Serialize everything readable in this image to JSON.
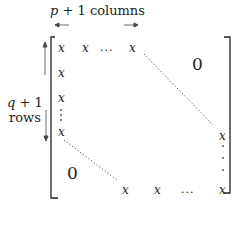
{
  "diagram": {
    "column_label": {
      "var": "p",
      "rest": " + 1 columns"
    },
    "row_label": {
      "var": "q",
      "rest": " + 1",
      "line2": "rows"
    },
    "arrows": {
      "left": "←",
      "right": "→"
    },
    "top_row": [
      "x",
      "x",
      "...",
      "x"
    ],
    "left_column": [
      "x",
      "x",
      "x"
    ],
    "bottom_row": [
      "x",
      "x",
      "...",
      "x"
    ],
    "right_column": [
      "x"
    ],
    "upper_zero": "0",
    "lower_zero": "0",
    "ellipsis_h": "...",
    "cell_symbol": "x"
  }
}
